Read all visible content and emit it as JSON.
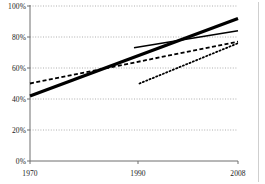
{
  "chart_data": {
    "type": "line",
    "title": "",
    "subtitle": "",
    "xlabel": "",
    "ylabel": "",
    "x": [
      1970,
      1990,
      2008
    ],
    "xlim": [
      1970,
      2008
    ],
    "ylim": [
      0,
      100
    ],
    "y_tick_labels": [
      "0%",
      "20%",
      "40%",
      "60%",
      "80%",
      "100%"
    ],
    "y_tick_values": [
      0,
      20,
      40,
      60,
      80,
      100
    ],
    "x_tick_labels": [
      "1970",
      "1990",
      "2008"
    ],
    "x_tick_values": [
      1970,
      1990,
      2008
    ],
    "grid": true,
    "grid_style": "dotted-horizontal",
    "legend": "none",
    "series": [
      {
        "name": "series-thick-solid",
        "style": "solid",
        "width": 3.2,
        "color": "#000000",
        "points": [
          {
            "x": 1970,
            "y": 42
          },
          {
            "x": 2008,
            "y": 92
          }
        ]
      },
      {
        "name": "series-dashed",
        "style": "dashed",
        "width": 1.8,
        "color": "#000000",
        "points": [
          {
            "x": 1970,
            "y": 50
          },
          {
            "x": 2008,
            "y": 77
          }
        ]
      },
      {
        "name": "series-thin-solid",
        "style": "solid",
        "width": 1.5,
        "color": "#000000",
        "points": [
          {
            "x": 1989,
            "y": 73
          },
          {
            "x": 2008,
            "y": 84
          }
        ]
      },
      {
        "name": "series-dotted",
        "style": "dotted",
        "width": 1.8,
        "color": "#000000",
        "points": [
          {
            "x": 1990,
            "y": 50
          },
          {
            "x": 2008,
            "y": 76
          }
        ]
      }
    ]
  },
  "axes": {
    "y_labels": [
      "100%",
      "80%",
      "60%",
      "40%",
      "20%",
      "0%"
    ],
    "x_labels": [
      "1970",
      "1990",
      "2008"
    ]
  }
}
